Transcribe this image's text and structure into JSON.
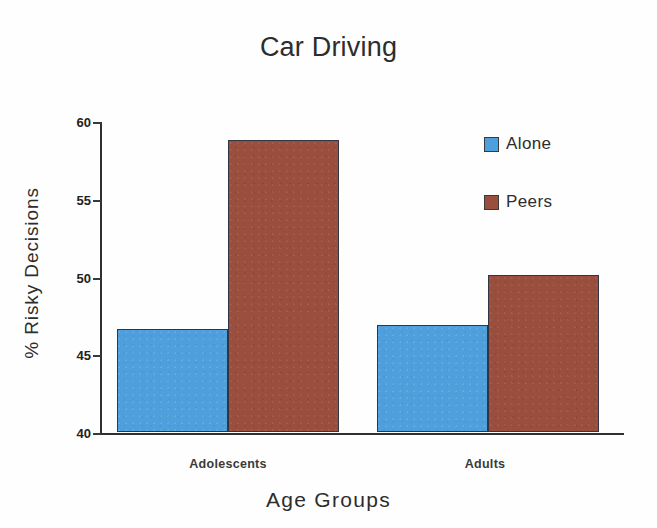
{
  "chart_data": {
    "type": "bar",
    "title": "Car Driving",
    "xlabel": "Age  Groups",
    "ylabel": "% Risky Decisions",
    "categories": [
      "Adolescents",
      "Adults"
    ],
    "series": [
      {
        "name": "Alone",
        "color": "#4f9fdc",
        "values": [
          46.6,
          46.9
        ]
      },
      {
        "name": "Peers",
        "color": "#9a4f3e",
        "values": [
          58.8,
          50.1
        ]
      }
    ],
    "ylim": [
      40,
      60
    ],
    "yticks": [
      40,
      45,
      50,
      55,
      60
    ],
    "ytick_labels": [
      "40",
      "45",
      "50",
      "55",
      "60"
    ],
    "grid": false,
    "legend_position": "right"
  },
  "legend": {
    "items": [
      {
        "label": "Alone",
        "swatch": "alone-swatch"
      },
      {
        "label": "Peers",
        "swatch": "peers-swatch"
      }
    ]
  }
}
